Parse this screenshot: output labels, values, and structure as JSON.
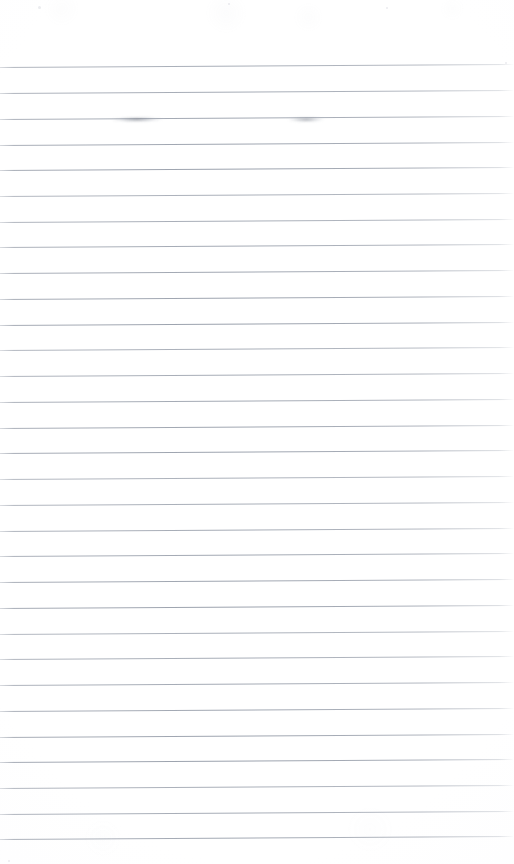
{
  "document": {
    "kind": "scanned-lined-paper",
    "title": "Blank ruled notebook page (scan)",
    "page_width": 514,
    "page_height": 864,
    "background_color": "#ffffff",
    "rule_color": "#9aa1ad",
    "orientation": "portrait",
    "text_content": "",
    "visible_text": "none"
  },
  "ruling": {
    "style": "wide-ruled horizontal lines",
    "line_count": 31,
    "first_line_y": 67,
    "line_spacing_px": 25.7,
    "line_thickness_px": 1,
    "tilt_px_over_width": -3.0,
    "top_margin_px": 67,
    "has_vertical_margin_rule": false,
    "lines": [
      {
        "index": 1,
        "y": 67
      },
      {
        "index": 2,
        "y": 93
      },
      {
        "index": 3,
        "y": 119
      },
      {
        "index": 4,
        "y": 145
      },
      {
        "index": 5,
        "y": 170
      },
      {
        "index": 6,
        "y": 196
      },
      {
        "index": 7,
        "y": 222
      },
      {
        "index": 8,
        "y": 247
      },
      {
        "index": 9,
        "y": 273
      },
      {
        "index": 10,
        "y": 299
      },
      {
        "index": 11,
        "y": 325
      },
      {
        "index": 12,
        "y": 350
      },
      {
        "index": 13,
        "y": 376
      },
      {
        "index": 14,
        "y": 402
      },
      {
        "index": 15,
        "y": 428
      },
      {
        "index": 16,
        "y": 453
      },
      {
        "index": 17,
        "y": 479
      },
      {
        "index": 18,
        "y": 505
      },
      {
        "index": 19,
        "y": 531
      },
      {
        "index": 20,
        "y": 556
      },
      {
        "index": 21,
        "y": 582
      },
      {
        "index": 22,
        "y": 608
      },
      {
        "index": 23,
        "y": 634
      },
      {
        "index": 24,
        "y": 659
      },
      {
        "index": 25,
        "y": 685
      },
      {
        "index": 26,
        "y": 711
      },
      {
        "index": 27,
        "y": 737
      },
      {
        "index": 28,
        "y": 762
      },
      {
        "index": 29,
        "y": 788
      },
      {
        "index": 30,
        "y": 814
      },
      {
        "index": 31,
        "y": 839
      }
    ]
  },
  "marks": {
    "description": "Two faint erased-pencil smudges sitting on the third ruled line",
    "items": [
      {
        "name": "smudge-left",
        "on_line": 3,
        "center_x": 133,
        "center_y": 120,
        "width": 62,
        "label": "faint erased pencil mark"
      },
      {
        "name": "smudge-right",
        "on_line": 3,
        "center_x": 308,
        "center_y": 120,
        "width": 48,
        "label": "faint erased pencil mark"
      }
    ]
  },
  "flecks": [
    {
      "x": 38,
      "y": 6,
      "size": 3
    },
    {
      "x": 228,
      "y": 3,
      "size": 2
    },
    {
      "x": 386,
      "y": 7,
      "size": 2
    },
    {
      "x": 505,
      "y": 62,
      "size": 2
    },
    {
      "x": 8,
      "y": 860,
      "size": 2
    }
  ]
}
